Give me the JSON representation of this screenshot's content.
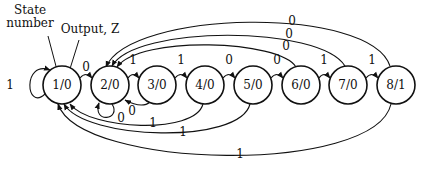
{
  "annotations": {
    "state_label_line1": "State",
    "state_label_line2": "number",
    "output_label": "Output, Z"
  },
  "nodes": [
    {
      "id": 1,
      "label": "1/0"
    },
    {
      "id": 2,
      "label": "2/0"
    },
    {
      "id": 3,
      "label": "3/0"
    },
    {
      "id": 4,
      "label": "4/0"
    },
    {
      "id": 5,
      "label": "5/0"
    },
    {
      "id": 6,
      "label": "6/0"
    },
    {
      "id": 7,
      "label": "7/0"
    },
    {
      "id": 8,
      "label": "8/1"
    }
  ],
  "edges": {
    "e1_1": {
      "from": 1,
      "to": 1,
      "label": "1"
    },
    "e1_2": {
      "from": 1,
      "to": 2,
      "label": "0"
    },
    "e2_2": {
      "from": 2,
      "to": 2,
      "label": "0"
    },
    "e2_3": {
      "from": 2,
      "to": 3,
      "label": "1"
    },
    "e3_2": {
      "from": 3,
      "to": 2,
      "label": "0"
    },
    "e3_4": {
      "from": 3,
      "to": 4,
      "label": "1"
    },
    "e4_5": {
      "from": 4,
      "to": 5,
      "label": "0"
    },
    "e4_1": {
      "from": 4,
      "to": 1,
      "label": "1"
    },
    "e5_6": {
      "from": 5,
      "to": 6,
      "label": "0"
    },
    "e5_1": {
      "from": 5,
      "to": 1,
      "label": "1"
    },
    "e6_7": {
      "from": 6,
      "to": 7,
      "label": "1"
    },
    "e6_2": {
      "from": 6,
      "to": 2,
      "label": "0"
    },
    "e7_8": {
      "from": 7,
      "to": 8,
      "label": "1"
    },
    "e7_2": {
      "from": 7,
      "to": 2,
      "label": "0"
    },
    "e8_2": {
      "from": 8,
      "to": 2,
      "label": "0"
    },
    "e8_1": {
      "from": 8,
      "to": 1,
      "label": "1"
    }
  }
}
